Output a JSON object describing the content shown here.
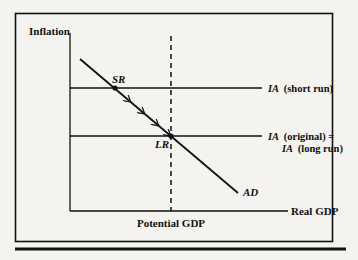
{
  "diagram": {
    "title": "",
    "y_axis_label": "Inflation",
    "x_axis_label": "Real GDP",
    "vertical_line_label": "Potential GDP",
    "curves": {
      "ia_short_run": {
        "abbr": "IA",
        "suffix": "(short run)"
      },
      "ia_original": {
        "abbr": "IA",
        "suffix": "(original) ="
      },
      "ia_long_run": {
        "abbr": "IA",
        "suffix": "(long run)"
      },
      "ad": {
        "label": "AD"
      }
    },
    "points": {
      "short_run": "SR",
      "long_run": "LR"
    },
    "colors": {
      "ink": "#111111",
      "paper": "#f4f3ef"
    }
  }
}
